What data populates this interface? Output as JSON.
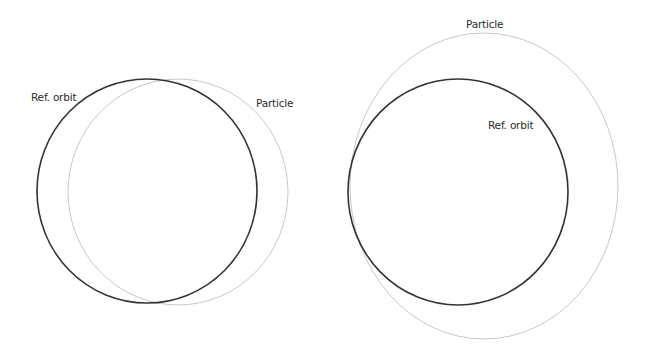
{
  "colors": {
    "ref_orbit": "#333333",
    "particle": "#c8c8c8",
    "background": "#ffffff",
    "label": "#2a2a2a"
  },
  "panels": [
    {
      "name": "left",
      "ref_orbit": {
        "label": "Ref. orbit",
        "cx": 147,
        "cy": 191,
        "rx": 110,
        "ry": 112
      },
      "particle": {
        "label": "Particle",
        "cx": 178,
        "cy": 192,
        "rx": 110,
        "ry": 113
      },
      "labels": {
        "ref_orbit": {
          "text": "Ref. orbit",
          "x": 31,
          "y": 101
        },
        "particle": {
          "text": "Particle",
          "x": 256,
          "y": 107
        }
      }
    },
    {
      "name": "right",
      "ref_orbit": {
        "label": "Ref. orbit",
        "cx": 458,
        "cy": 192,
        "rx": 110,
        "ry": 113
      },
      "particle": {
        "label": "Particle",
        "cx": 484,
        "cy": 186,
        "rx": 134,
        "ry": 153
      },
      "labels": {
        "particle": {
          "text": "Particle",
          "x": 466,
          "y": 28
        },
        "ref_orbit": {
          "text": "Ref. orbit",
          "x": 488,
          "y": 129
        }
      }
    }
  ]
}
